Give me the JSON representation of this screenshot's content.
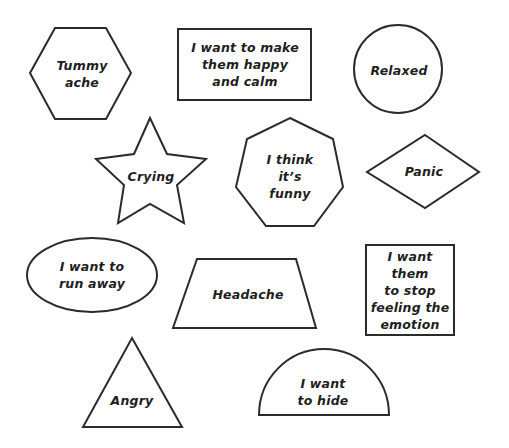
{
  "worksheet": {
    "stroke_color": "#2b2b2b",
    "text_color": "#1e1e1e",
    "background": "#ffffff",
    "shapes": [
      {
        "id": "hexagon",
        "label": "Tummy\nache",
        "x": 82,
        "y": 74
      },
      {
        "id": "rectangle-wide",
        "label": "I want to make\nthem happy\nand calm",
        "x": 245,
        "y": 64
      },
      {
        "id": "circle",
        "label": "Relaxed",
        "x": 399,
        "y": 70
      },
      {
        "id": "star",
        "label": "Crying",
        "x": 151,
        "y": 176
      },
      {
        "id": "heptagon",
        "label": "I think\nit’s\nfunny",
        "x": 290,
        "y": 176
      },
      {
        "id": "diamond",
        "label": "Panic",
        "x": 424,
        "y": 171
      },
      {
        "id": "ellipse",
        "label": "I want to\nrun away",
        "x": 92,
        "y": 275
      },
      {
        "id": "trapezoid",
        "label": "Headache",
        "x": 248,
        "y": 294
      },
      {
        "id": "rectangle-square",
        "label": "I want\nthem\nto stop\nfeeling the\nemotion",
        "x": 410,
        "y": 290
      },
      {
        "id": "triangle",
        "label": "Angry",
        "x": 132,
        "y": 400
      },
      {
        "id": "semicircle",
        "label": "I want\nto hide",
        "x": 323,
        "y": 392
      }
    ]
  }
}
